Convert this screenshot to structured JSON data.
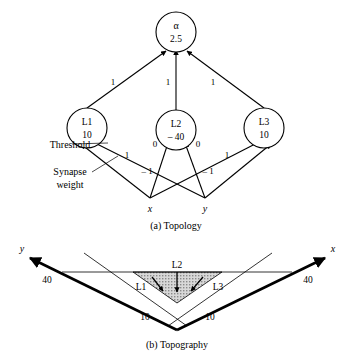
{
  "figure": {
    "panel_a": {
      "caption": "(a)  Topology",
      "output_node": {
        "name": "alpha",
        "symbol": "α",
        "threshold": "2.5"
      },
      "hidden_nodes": [
        {
          "name": "L1",
          "label": "L1",
          "threshold": "10"
        },
        {
          "name": "L2",
          "label": "L2",
          "threshold": "– 40"
        },
        {
          "name": "L3",
          "label": "L3",
          "threshold": "10"
        }
      ],
      "inputs": [
        {
          "name": "x",
          "label": "x"
        },
        {
          "name": "y",
          "label": "y"
        }
      ],
      "output_weights": [
        {
          "from": "L1",
          "to": "alpha",
          "label": "1"
        },
        {
          "from": "L2",
          "to": "alpha",
          "label": "1"
        },
        {
          "from": "L3",
          "to": "alpha",
          "label": "1"
        }
      ],
      "input_weights": [
        {
          "from": "x",
          "to": "L1",
          "label": "1"
        },
        {
          "from": "y",
          "to": "L1",
          "label": "– 1"
        },
        {
          "from": "x",
          "to": "L2",
          "label": "0"
        },
        {
          "from": "y",
          "to": "L2",
          "label": "0"
        },
        {
          "from": "x",
          "to": "L3",
          "label": "– 1"
        },
        {
          "from": "y",
          "to": "L3",
          "label": "1"
        }
      ],
      "annotations": [
        {
          "name": "threshold",
          "label": "Threshold"
        },
        {
          "name": "synapse-weight-line1",
          "label": "Synapse"
        },
        {
          "name": "synapse-weight-line2",
          "label": "weight"
        }
      ]
    },
    "panel_b": {
      "caption": "(b)  Topography",
      "axes": [
        {
          "name": "y-axis",
          "label": "y",
          "value": "40"
        },
        {
          "name": "x-axis",
          "label": "x",
          "value": "40"
        }
      ],
      "region_labels": [
        {
          "name": "L1",
          "label": "L1"
        },
        {
          "name": "L2",
          "label": "L2"
        },
        {
          "name": "L3",
          "label": "L3"
        }
      ],
      "inner_values": [
        {
          "name": "left-ten",
          "label": "10"
        },
        {
          "name": "right-ten",
          "label": "10"
        }
      ]
    }
  },
  "colors": {
    "ink": "#000000",
    "paper": "#ffffff",
    "shade": "#c9c9c9"
  }
}
